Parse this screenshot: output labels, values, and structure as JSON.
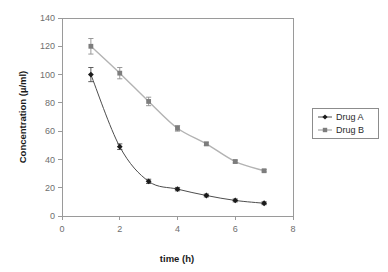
{
  "chart_data": {
    "type": "line",
    "title": "",
    "xlabel": "time (h)",
    "ylabel": "Concentration (µ/ml)",
    "xlim": [
      0,
      8
    ],
    "ylim": [
      0,
      140
    ],
    "xticks": [
      "0",
      "2",
      "4",
      "6",
      "8"
    ],
    "xtick_values": [
      0,
      2,
      4,
      6,
      8
    ],
    "yticks": [
      "0",
      "20",
      "40",
      "60",
      "80",
      "100",
      "120",
      "140"
    ],
    "ytick_values": [
      0,
      20,
      40,
      60,
      80,
      100,
      120,
      140
    ],
    "grid": false,
    "legend_position": "right",
    "x": [
      1,
      2,
      3,
      4,
      5,
      6,
      7
    ],
    "series": [
      {
        "name": "Drug A",
        "marker": "diamond",
        "color": "#1a1a1a",
        "values": [
          100,
          49,
          24.5,
          19,
          14.5,
          11,
          9
        ],
        "errors": [
          5,
          2,
          1.5,
          1.2,
          1,
          1,
          1
        ]
      },
      {
        "name": "Drug B",
        "marker": "square",
        "color": "#7d7d7d",
        "values": [
          120,
          101,
          81,
          62,
          51,
          38.5,
          32
        ],
        "errors": [
          5.5,
          4,
          3,
          2,
          1.2,
          1,
          0.8
        ]
      }
    ]
  },
  "legend": {
    "entries": [
      {
        "label": "Drug A"
      },
      {
        "label": "Drug B"
      }
    ]
  },
  "axes": {
    "x_title": "time (h)",
    "y_title": "Concentration (µ/ml)"
  }
}
